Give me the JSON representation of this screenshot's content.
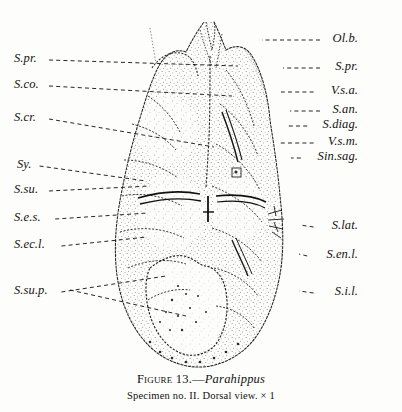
{
  "figure": {
    "caption_prefix": "Figure 13.",
    "caption_dash": "—",
    "taxon": "Parahippus",
    "subcaption": "Specimen no. II.   Dorsal view.   × 1",
    "background_color": "#fdfdfb",
    "ink_color": "#121212"
  },
  "labels_left": [
    {
      "text": "S.pr.",
      "x": 14,
      "y": 60,
      "leader_to_x": 238,
      "leader_to_y": 66
    },
    {
      "text": "S.co.",
      "x": 14,
      "y": 86,
      "leader_to_x": 232,
      "leader_to_y": 96
    },
    {
      "text": "S.cr.",
      "x": 14,
      "y": 119,
      "leader_to_x": 214,
      "leader_to_y": 147
    },
    {
      "text": "Sy.",
      "x": 17,
      "y": 166,
      "leader_to_x": 146,
      "leader_to_y": 181
    },
    {
      "text": "S.su.",
      "x": 14,
      "y": 191,
      "leader_to_x": 150,
      "leader_to_y": 186
    },
    {
      "text": "S.e.s.",
      "x": 14,
      "y": 219,
      "leader_to_x": 148,
      "leader_to_y": 213
    },
    {
      "text": "S.ec.l.",
      "x": 14,
      "y": 246,
      "leader_to_x": 147,
      "leader_to_y": 237
    },
    {
      "text": "S.su.p.",
      "x": 14,
      "y": 292,
      "leader_to_x": 166,
      "leader_to_y": 276
    }
  ],
  "labels_right": [
    {
      "text": "Ol.b.",
      "x": 358,
      "y": 40,
      "leader_to_x": 262,
      "leader_to_y": 40
    },
    {
      "text": "S.pr.",
      "x": 358,
      "y": 68,
      "leader_to_x": 283,
      "leader_to_y": 68
    },
    {
      "text": "V.s.a.",
      "x": 358,
      "y": 92,
      "leader_to_x": 281,
      "leader_to_y": 92
    },
    {
      "text": "S.an.",
      "x": 358,
      "y": 111,
      "leader_to_x": 290,
      "leader_to_y": 111
    },
    {
      "text": "S.diag.",
      "x": 358,
      "y": 126,
      "leader_to_x": 288,
      "leader_to_y": 126
    },
    {
      "text": "V.s.m.",
      "x": 358,
      "y": 143,
      "leader_to_x": 278,
      "leader_to_y": 143
    },
    {
      "text": "Sin.sag.",
      "x": 358,
      "y": 158,
      "leader_to_x": 291,
      "leader_to_y": 158
    },
    {
      "text": "S.lat.",
      "x": 358,
      "y": 227,
      "leader_to_x": 300,
      "leader_to_y": 225
    },
    {
      "text": "S.en.l.",
      "x": 358,
      "y": 256,
      "leader_to_x": 299,
      "leader_to_y": 254
    },
    {
      "text": "S.i.l.",
      "x": 358,
      "y": 293,
      "leader_to_x": 299,
      "leader_to_y": 291
    }
  ],
  "specimen": {
    "name": "endocast-dorsal-view",
    "description": "Stippled line drawing of a brain endocast in dorsal view, ovoid outline, olfactory bulbs at top, cerebral hemispheres with sulci, cerebellum and vermis at lower portion."
  }
}
